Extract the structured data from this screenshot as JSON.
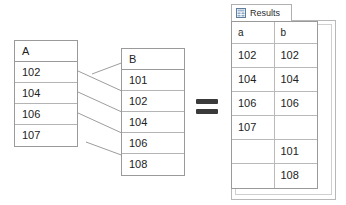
{
  "diagram": {
    "equals_symbol": "=",
    "colors": {
      "table_border": "#9a9a9a",
      "row_divider": "#b9b9b9",
      "connector_line": "#9d9d9d",
      "text": "#222222",
      "panel_border": "#b8b8b8",
      "icon_blue": "#6f8fb5",
      "background": "#ffffff"
    }
  },
  "table_a": {
    "name": "A",
    "header": "A",
    "rows": [
      "102",
      "104",
      "106",
      "107"
    ]
  },
  "table_b": {
    "name": "B",
    "header": "B",
    "rows": [
      "101",
      "102",
      "104",
      "106",
      "108"
    ]
  },
  "results": {
    "tab_label": "Results",
    "tab_icon": "grid-icon",
    "columns": [
      "a",
      "b"
    ],
    "rows": [
      {
        "a": "102",
        "b": "102"
      },
      {
        "a": "104",
        "b": "104"
      },
      {
        "a": "106",
        "b": "106"
      },
      {
        "a": "107",
        "b": ""
      },
      {
        "a": "",
        "b": "101"
      },
      {
        "a": "",
        "b": "108"
      }
    ]
  },
  "connectors": [
    {
      "from": "A.above",
      "to": "B.101",
      "x1": 78,
      "y1": 82,
      "x2": 121,
      "y2": 62
    },
    {
      "from": "A.102",
      "to": "B.102",
      "x1": 78,
      "y1": 71,
      "x2": 121,
      "y2": 92
    },
    {
      "from": "A.104",
      "to": "B.104",
      "x1": 78,
      "y1": 92,
      "x2": 121,
      "y2": 113
    },
    {
      "from": "A.106",
      "to": "B.106",
      "x1": 78,
      "y1": 113,
      "x2": 121,
      "y2": 134
    },
    {
      "from": "A.107",
      "to": "B.108",
      "x1": 78,
      "y1": 146,
      "x2": 121,
      "y2": 155
    }
  ]
}
